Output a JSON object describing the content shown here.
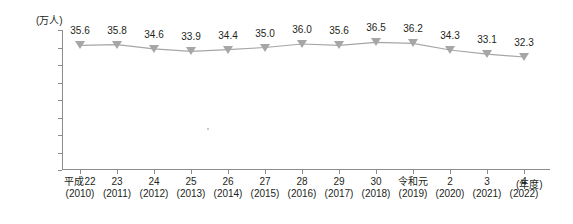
{
  "chart_data": {
    "type": "line",
    "title": "",
    "subtitle": "",
    "xlabel": "(年度)",
    "ylabel": "(万人)",
    "ylim": [
      0,
      40
    ],
    "yticks": [
      0,
      5,
      10,
      15,
      20,
      25,
      30,
      35,
      40
    ],
    "grid": false,
    "legend": "none",
    "marker": "triangle-down",
    "series_color": "#a6a6a6",
    "categories": [
      "平成22",
      "23",
      "24",
      "25",
      "26",
      "27",
      "28",
      "29",
      "30",
      "令和元",
      "2",
      "3",
      "4"
    ],
    "categories_sub": [
      "(2010)",
      "(2011)",
      "(2012)",
      "(2013)",
      "(2014)",
      "(2015)",
      "(2016)",
      "(2017)",
      "(2018)",
      "(2019)",
      "(2020)",
      "(2021)",
      "(2022)"
    ],
    "values": [
      35.6,
      35.8,
      34.6,
      33.9,
      34.4,
      35.0,
      36.0,
      35.6,
      36.5,
      36.2,
      34.3,
      33.1,
      32.3
    ],
    "value_labels": [
      "35.6",
      "35.8",
      "34.6",
      "33.9",
      "34.4",
      "35.0",
      "36.0",
      "35.6",
      "36.5",
      "36.2",
      "34.3",
      "33.1",
      "32.3"
    ]
  }
}
